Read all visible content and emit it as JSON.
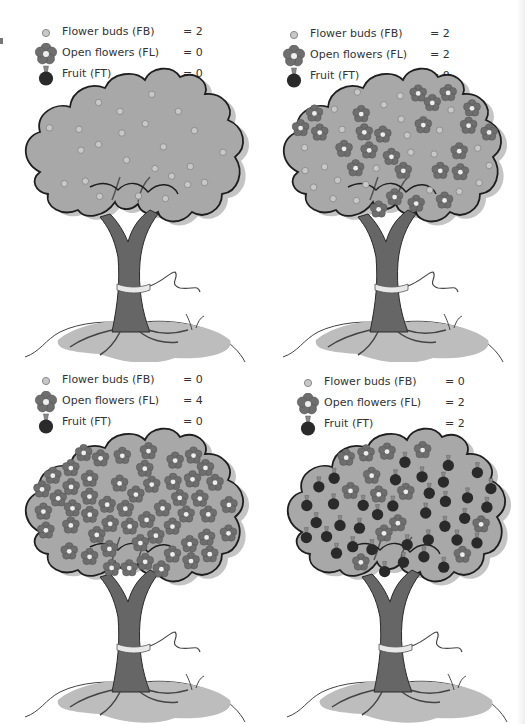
{
  "colors": {
    "canopy": "#a8a8a8",
    "canopy_shadow": "#c4c4c4",
    "outline": "#1e1e1e",
    "trunk": "#666666",
    "ground": "#bdbdbd",
    "bud": "#c8c8c8",
    "flower_petal": "#6e6e6e",
    "flower_center": "#eeeeee",
    "fruit": "#2a2a2a",
    "text": "#333333"
  },
  "legend_labels": {
    "buds": "Flower buds (FB)",
    "flowers": "Open flowers (FL)",
    "fruit": "Fruit (FT)"
  },
  "panels": [
    {
      "id": "top-left",
      "legend": {
        "buds": {
          "label": "Flower buds (FB)",
          "value": "= 2"
        },
        "flowers": {
          "label": "Open flowers (FL)",
          "value": "= 0"
        },
        "fruit": {
          "label": "Fruit (FT)",
          "value": "= 0"
        }
      },
      "counts": {
        "FB": 2,
        "FL": 0,
        "FT": 0
      },
      "stage": "buds only"
    },
    {
      "id": "top-right",
      "legend": {
        "buds": {
          "label": "Flower buds (FB)",
          "value": "= 2"
        },
        "flowers": {
          "label": "Open flowers (FL)",
          "value": "= 2"
        },
        "fruit": {
          "label": "Fruit (FT)",
          "value": "= 0"
        }
      },
      "counts": {
        "FB": 2,
        "FL": 2,
        "FT": 0
      },
      "stage": "buds and flowers"
    },
    {
      "id": "bottom-left",
      "legend": {
        "buds": {
          "label": "Flower buds (FB)",
          "value": "= 0"
        },
        "flowers": {
          "label": "Open flowers (FL)",
          "value": "= 4"
        },
        "fruit": {
          "label": "Fruit (FT)",
          "value": "= 0"
        }
      },
      "counts": {
        "FB": 0,
        "FL": 4,
        "FT": 0
      },
      "stage": "full bloom"
    },
    {
      "id": "bottom-right",
      "legend": {
        "buds": {
          "label": "Flower buds (FB)",
          "value": "= 0"
        },
        "flowers": {
          "label": "Open flowers (FL)",
          "value": "= 2"
        },
        "fruit": {
          "label": "Fruit (FT)",
          "value": "= 2"
        }
      },
      "counts": {
        "FB": 0,
        "FL": 2,
        "FT": 2
      },
      "stage": "flowers and fruit"
    }
  ]
}
